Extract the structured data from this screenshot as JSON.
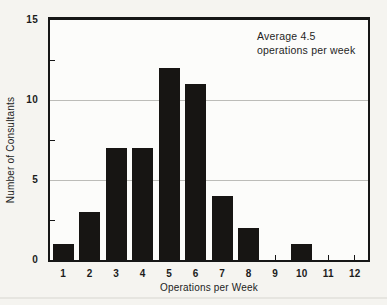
{
  "chart_data": {
    "type": "bar",
    "categories": [
      "1",
      "2",
      "3",
      "4",
      "5",
      "6",
      "7",
      "8",
      "9",
      "10",
      "11",
      "12"
    ],
    "values": [
      1,
      3,
      7,
      7,
      12,
      11,
      4,
      2,
      0,
      1,
      0,
      0
    ],
    "title": "",
    "xlabel": "Operations per Week",
    "ylabel": "Number of Consultants",
    "ylim": [
      0,
      15
    ],
    "yticks": [
      0,
      5,
      10,
      15
    ],
    "yticks_minor": [
      2.5,
      7.5,
      12.5
    ],
    "gridlines": [
      5,
      10
    ],
    "grid_on": true,
    "legend": "none",
    "annotation_lines": [
      "Average 4.5",
      "operations per week"
    ],
    "bar_color": "#171513",
    "grid_color": "#bcbcb8",
    "frame_color": "#161616",
    "background_color": "#f5f4f0"
  }
}
